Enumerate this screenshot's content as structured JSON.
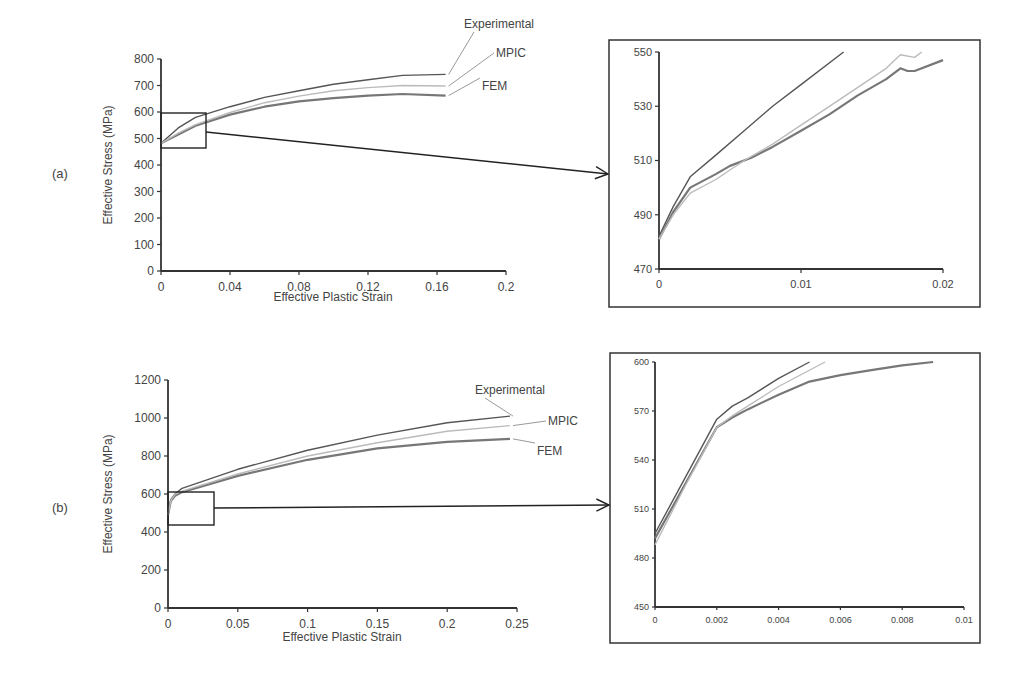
{
  "panels": [
    {
      "label": "(a)"
    },
    {
      "label": "(b)"
    }
  ],
  "chart_data": [
    {
      "id": "a_main",
      "type": "line",
      "panel": "(a)",
      "title": "",
      "xlabel": "Effective Plastic Strain",
      "ylabel": "Effective Stress (MPa)",
      "xlim": [
        0,
        0.2
      ],
      "ylim": [
        0,
        800
      ],
      "xticks": [
        "0",
        "0.04",
        "0.08",
        "0.12",
        "0.16",
        "0.2"
      ],
      "yticks": [
        "0",
        "100",
        "200",
        "300",
        "400",
        "500",
        "600",
        "700",
        "800"
      ],
      "grid": false,
      "legend": "inline labels at line ends (right)",
      "series": [
        {
          "name": "Experimental",
          "color": "#555555",
          "x": [
            0,
            0.01,
            0.02,
            0.04,
            0.06,
            0.08,
            0.1,
            0.12,
            0.14,
            0.165
          ],
          "y": [
            482,
            540,
            580,
            620,
            655,
            680,
            705,
            722,
            738,
            742
          ]
        },
        {
          "name": "MPIC",
          "color": "#bbbbbb",
          "x": [
            0,
            0.01,
            0.02,
            0.04,
            0.06,
            0.08,
            0.1,
            0.12,
            0.14,
            0.165
          ],
          "y": [
            482,
            520,
            552,
            598,
            635,
            660,
            680,
            692,
            700,
            698
          ]
        },
        {
          "name": "FEM",
          "color": "#777777",
          "x": [
            0,
            0.01,
            0.02,
            0.04,
            0.06,
            0.08,
            0.1,
            0.12,
            0.14,
            0.165
          ],
          "y": [
            482,
            515,
            548,
            590,
            620,
            640,
            652,
            662,
            668,
            662
          ]
        }
      ],
      "annotations": [
        "zoom box: x 0–0.026, y 460–595",
        "arrow to inset"
      ]
    },
    {
      "id": "a_inset",
      "type": "line",
      "panel": "(a) inset",
      "xlim": [
        0,
        0.02
      ],
      "ylim": [
        470,
        550
      ],
      "xticks": [
        "0",
        "0.01",
        "0.02"
      ],
      "yticks": [
        "470",
        "490",
        "510",
        "530",
        "550"
      ],
      "grid": false,
      "series": [
        {
          "name": "Experimental",
          "color": "#555555",
          "x": [
            0,
            0.001,
            0.0022,
            0.004,
            0.006,
            0.008,
            0.01,
            0.013
          ],
          "y": [
            482,
            493,
            504,
            512,
            521,
            530,
            538,
            550
          ]
        },
        {
          "name": "MPIC",
          "color": "#bbbbbb",
          "x": [
            0,
            0.001,
            0.0022,
            0.004,
            0.006,
            0.008,
            0.01,
            0.012,
            0.014,
            0.016,
            0.017,
            0.018,
            0.0185
          ],
          "y": [
            481,
            490,
            498,
            503,
            510,
            516,
            523,
            530,
            537,
            544,
            549,
            548,
            550
          ]
        },
        {
          "name": "FEM",
          "color": "#777777",
          "x": [
            0,
            0.001,
            0.0022,
            0.004,
            0.005,
            0.0065,
            0.008,
            0.01,
            0.012,
            0.014,
            0.016,
            0.017,
            0.0175,
            0.018,
            0.02
          ],
          "y": [
            481,
            491,
            500,
            505,
            508,
            511,
            515,
            521,
            527,
            534,
            540,
            544,
            543,
            543,
            547
          ]
        }
      ]
    },
    {
      "id": "b_main",
      "type": "line",
      "panel": "(b)",
      "title": "",
      "xlabel": "Effective Plastic Strain",
      "ylabel": "Effective Stress (MPa)",
      "xlim": [
        0,
        0.25
      ],
      "ylim": [
        0,
        1200
      ],
      "xticks": [
        "0",
        "0.05",
        "0.1",
        "0.15",
        "0.2",
        "0.25"
      ],
      "yticks": [
        "0",
        "200",
        "400",
        "600",
        "800",
        "1000",
        "1200"
      ],
      "grid": false,
      "legend": "inline labels at line ends (right)",
      "series": [
        {
          "name": "Experimental",
          "color": "#555555",
          "x": [
            0,
            0.002,
            0.005,
            0.01,
            0.05,
            0.1,
            0.15,
            0.2,
            0.245
          ],
          "y": [
            490,
            570,
            600,
            630,
            730,
            830,
            910,
            975,
            1010
          ]
        },
        {
          "name": "MPIC",
          "color": "#bbbbbb",
          "x": [
            0,
            0.002,
            0.005,
            0.01,
            0.05,
            0.1,
            0.15,
            0.2,
            0.245
          ],
          "y": [
            490,
            565,
            598,
            615,
            705,
            800,
            870,
            930,
            960
          ]
        },
        {
          "name": "FEM",
          "color": "#777777",
          "x": [
            0,
            0.002,
            0.005,
            0.01,
            0.05,
            0.1,
            0.15,
            0.2,
            0.245
          ],
          "y": [
            490,
            563,
            590,
            610,
            695,
            780,
            840,
            875,
            890
          ]
        }
      ],
      "annotations": [
        "zoom box: x 0–0.032, y 430–610",
        "arrow to inset"
      ]
    },
    {
      "id": "b_inset",
      "type": "line",
      "panel": "(b) inset",
      "xlim": [
        0,
        0.01
      ],
      "ylim": [
        450,
        600
      ],
      "xticks": [
        "0",
        "0.002",
        "0.004",
        "0.006",
        "0.008",
        "0.01"
      ],
      "yticks": [
        "450",
        "480",
        "510",
        "540",
        "570",
        "600"
      ],
      "grid": false,
      "series": [
        {
          "name": "Experimental",
          "color": "#555555",
          "x": [
            0,
            0.001,
            0.002,
            0.0025,
            0.003,
            0.004,
            0.005
          ],
          "y": [
            495,
            530,
            565,
            573,
            578,
            590,
            600
          ]
        },
        {
          "name": "MPIC",
          "color": "#bbbbbb",
          "x": [
            0,
            0.001,
            0.002,
            0.0025,
            0.003,
            0.004,
            0.0055
          ],
          "y": [
            488,
            525,
            560,
            567,
            573,
            585,
            600
          ]
        },
        {
          "name": "FEM",
          "color": "#777777",
          "x": [
            0,
            0.001,
            0.002,
            0.0025,
            0.003,
            0.004,
            0.005,
            0.006,
            0.007,
            0.008,
            0.009
          ],
          "y": [
            492,
            526,
            560,
            566,
            571,
            580,
            588,
            592,
            595,
            598,
            600
          ]
        }
      ]
    }
  ]
}
